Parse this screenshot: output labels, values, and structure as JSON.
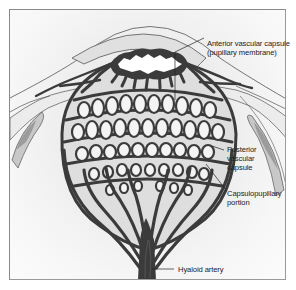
{
  "figure": {
    "labels": {
      "anterior_line1": "Anterior vascular capsule",
      "anterior_line2": "(pupillary membrane)",
      "posterior_line1": "Posterior",
      "posterior_line2": "vascular",
      "posterior_line3": "capsule",
      "capsulo_line1": "Capsulopupillary",
      "capsulo_line2": "portion",
      "hyaloid": "Hyaloid artery"
    },
    "colors": {
      "vessel": "#3b3b3b",
      "lens": "#e6e6e6",
      "cornea": "#dcdcdc",
      "ciliary": "#a8a8a8",
      "border": "#8a8a8a",
      "background": "#f2f2f2"
    }
  }
}
